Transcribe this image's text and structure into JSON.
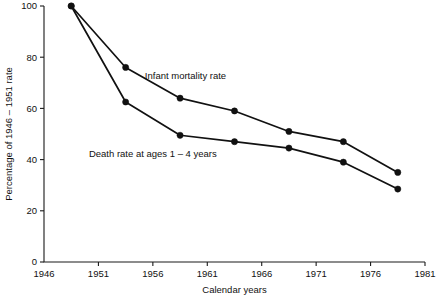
{
  "chart_data": {
    "type": "line",
    "title": "",
    "subtitle": "",
    "xlabel": "Calendar years",
    "ylabel": "Percentage of 1946 – 1951 rate",
    "xlim": [
      1946,
      1981
    ],
    "ylim": [
      0,
      100
    ],
    "xticks": [
      1946,
      1951,
      1956,
      1961,
      1966,
      1971,
      1976,
      1981
    ],
    "xtick_labels": [
      "1946",
      "1951",
      "1956",
      "1961",
      "1966",
      "1971",
      "1976",
      "1981"
    ],
    "yticks": [
      0,
      20,
      40,
      60,
      80,
      100
    ],
    "ytick_labels": [
      "0",
      "20",
      "40",
      "60",
      "80",
      "100"
    ],
    "grid": false,
    "legend_position": "inline-annotations",
    "x": [
      1948.5,
      1953.5,
      1958.5,
      1963.5,
      1968.5,
      1973.5,
      1978.5
    ],
    "series": [
      {
        "name": "Infant mortality rate",
        "label_x": 1959.0,
        "label_y": 71.5,
        "values": [
          100,
          76,
          64,
          59,
          51,
          47,
          35
        ]
      },
      {
        "name": "Death rate at ages 1 – 4 years",
        "label_x": 1956.0,
        "label_y": 41.0,
        "values": [
          100,
          62.5,
          49.5,
          47,
          44.5,
          39,
          28.5
        ]
      }
    ],
    "colors": {
      "line": "#111111",
      "marker": "#111111",
      "axis": "#1a1a1a",
      "background": "#ffffff",
      "text": "#111111"
    }
  },
  "labels": {
    "series_1": "Infant mortality rate",
    "series_2": "Death rate at ages 1 – 4 years",
    "x_axis_title": "Calendar years",
    "y_axis_title": "Percentage of 1946 – 1951 rate"
  }
}
